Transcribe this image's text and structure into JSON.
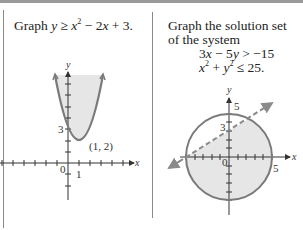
{
  "left_panel": {
    "prompt_prefix": "Graph ",
    "inequality": {
      "lhs": "y",
      "op": "≥",
      "rhs_terms": [
        "x",
        "2",
        " − 2",
        "x",
        " + 3."
      ]
    },
    "graph": {
      "x_label": "x",
      "y_label": "y",
      "y_intercept_label": "3",
      "vertex_label": "(1, 2)",
      "origin_label": "0",
      "x_tick_label": "1",
      "fill_color": "#e6e6e6",
      "curve_color": "#7a7a7a"
    }
  },
  "right_panel": {
    "prompt_line1": "Graph the solution set",
    "prompt_line2": "of the system",
    "eq1": "3x − 5y > −15",
    "eq2": "x² + y² ≤ 25.",
    "graph": {
      "x_label": "x",
      "y_label": "y",
      "top_label": "5",
      "right_label": "5",
      "y_intercept_label": "3",
      "origin_label": "0",
      "fill_color": "#e6e6e6",
      "circle_color": "#7a7a7a",
      "line_color": "#8a8a8a",
      "line_style": "dashed"
    }
  }
}
